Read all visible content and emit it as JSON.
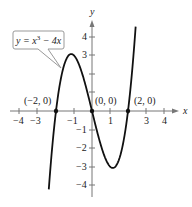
{
  "chart_data": {
    "type": "line",
    "title": "",
    "function_label": "y = x^3 - 4x",
    "xlabel": "x",
    "ylabel": "y",
    "xlim": [
      -4.5,
      4.9
    ],
    "ylim": [
      -4.6,
      4.8
    ],
    "grid": false,
    "x_ticks": [
      -4,
      -3,
      -1,
      1,
      3,
      4
    ],
    "x_tick_labels": [
      "−4",
      "−3",
      "−1",
      "1",
      "3",
      "4"
    ],
    "y_ticks": [
      -4,
      -3,
      -2,
      -1,
      3,
      4
    ],
    "y_tick_labels": [
      "−4",
      "−3",
      "−2",
      "−1",
      "3",
      "4"
    ],
    "series": [
      {
        "name": "y = x^3 - 4x",
        "x": [
          -2.5,
          -2,
          -1.5,
          -1.155,
          -0.5,
          0,
          0.5,
          1.155,
          1.5,
          2,
          2.45
        ],
        "y": [
          -5.625,
          0,
          2.625,
          3.079,
          1.875,
          0,
          -1.875,
          -3.079,
          -2.625,
          0,
          4.906
        ]
      }
    ],
    "points": [
      {
        "label": "(−2, 0)",
        "x": -2,
        "y": 0
      },
      {
        "label": "(0, 0)",
        "x": 0,
        "y": 0
      },
      {
        "label": "(2, 0)",
        "x": 2,
        "y": 0
      }
    ]
  },
  "labels": {
    "x_axis": "x",
    "y_axis": "y",
    "callout_y": "y = x",
    "callout_exp": "3",
    "callout_rest": " − 4x",
    "pt1": "(−2, 0)",
    "pt2": "(0, 0)",
    "pt3": "(2, 0)",
    "xt_m4": "−4",
    "xt_m3": "−3",
    "xt_m1": "−1",
    "xt_1": "1",
    "xt_3": "3",
    "xt_4": "4",
    "yt_4": "4",
    "yt_3": "3",
    "yt_m1": "−1",
    "yt_m2": "−2",
    "yt_m3": "−3",
    "yt_m4": "−4"
  }
}
